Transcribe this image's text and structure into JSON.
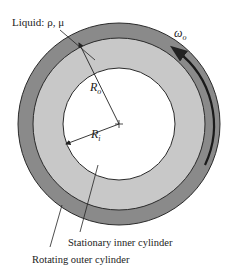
{
  "diagram": {
    "labels": {
      "liquid": "Liquid: ρ, μ",
      "omega": "ω",
      "omega_sub": "o",
      "r_outer": "R",
      "r_outer_sub": "o",
      "r_inner": "R",
      "r_inner_sub": "i",
      "inner_cylinder": "Stationary inner cylinder",
      "outer_cylinder": "Rotating outer cylinder"
    },
    "geometry": {
      "center": [
        119,
        124
      ],
      "outer_wall_radius": 101,
      "outer_wall_inner_radius": 86,
      "inner_cylinder_radius": 56
    },
    "colors": {
      "outer_wall": "#8a8a8a",
      "liquid": "#c8c8c8",
      "inner_cylinder": "#ffffff",
      "stroke": "#2a2a2a"
    }
  }
}
